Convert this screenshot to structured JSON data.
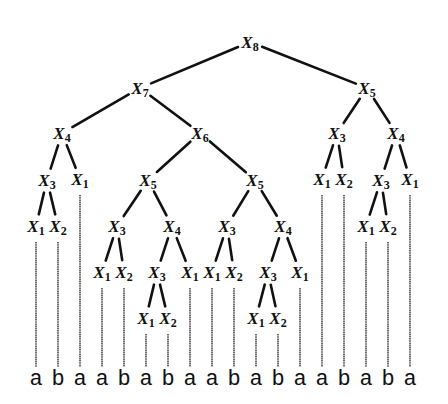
{
  "diagram": {
    "type": "derivation-tree",
    "nodes": [
      {
        "id": "n8",
        "var": "X",
        "sub": "8",
        "children": [
          "n7",
          "n5r"
        ]
      },
      {
        "id": "n7",
        "var": "X",
        "sub": "7",
        "children": [
          "n4a",
          "n6"
        ]
      },
      {
        "id": "n4a",
        "var": "X",
        "sub": "4",
        "children": [
          "n3a",
          "l2"
        ]
      },
      {
        "id": "n3a",
        "var": "X",
        "sub": "3",
        "children": [
          "l0",
          "l1"
        ]
      },
      {
        "id": "n6",
        "var": "X",
        "sub": "6",
        "children": [
          "n5a",
          "n5b"
        ]
      },
      {
        "id": "n5a",
        "var": "X",
        "sub": "5",
        "children": [
          "n3b",
          "n4b"
        ]
      },
      {
        "id": "n3b",
        "var": "X",
        "sub": "3",
        "children": [
          "l3",
          "l4"
        ]
      },
      {
        "id": "n4b",
        "var": "X",
        "sub": "4",
        "children": [
          "n3c",
          "l7"
        ]
      },
      {
        "id": "n3c",
        "var": "X",
        "sub": "3",
        "children": [
          "l5",
          "l6"
        ]
      },
      {
        "id": "n5b",
        "var": "X",
        "sub": "5",
        "children": [
          "n3d",
          "n4c"
        ]
      },
      {
        "id": "n3d",
        "var": "X",
        "sub": "3",
        "children": [
          "l8",
          "l9"
        ]
      },
      {
        "id": "n4c",
        "var": "X",
        "sub": "4",
        "children": [
          "n3e",
          "l12"
        ]
      },
      {
        "id": "n3e",
        "var": "X",
        "sub": "3",
        "children": [
          "l10",
          "l11"
        ]
      },
      {
        "id": "n5r",
        "var": "X",
        "sub": "5",
        "children": [
          "n3f",
          "n4d"
        ]
      },
      {
        "id": "n3f",
        "var": "X",
        "sub": "3",
        "children": [
          "l13",
          "l14"
        ]
      },
      {
        "id": "n4d",
        "var": "X",
        "sub": "4",
        "children": [
          "n3g",
          "l17"
        ]
      },
      {
        "id": "n3g",
        "var": "X",
        "sub": "3",
        "children": [
          "l15",
          "l16"
        ]
      }
    ],
    "preterminals": [
      {
        "leaf": 0,
        "var": "X",
        "sub": "1"
      },
      {
        "leaf": 1,
        "var": "X",
        "sub": "2"
      },
      {
        "leaf": 2,
        "var": "X",
        "sub": "1"
      },
      {
        "leaf": 3,
        "var": "X",
        "sub": "1"
      },
      {
        "leaf": 4,
        "var": "X",
        "sub": "2"
      },
      {
        "leaf": 5,
        "var": "X",
        "sub": "1"
      },
      {
        "leaf": 6,
        "var": "X",
        "sub": "2"
      },
      {
        "leaf": 7,
        "var": "X",
        "sub": "1"
      },
      {
        "leaf": 8,
        "var": "X",
        "sub": "1"
      },
      {
        "leaf": 9,
        "var": "X",
        "sub": "2"
      },
      {
        "leaf": 10,
        "var": "X",
        "sub": "1"
      },
      {
        "leaf": 11,
        "var": "X",
        "sub": "2"
      },
      {
        "leaf": 12,
        "var": "X",
        "sub": "1"
      },
      {
        "leaf": 13,
        "var": "X",
        "sub": "1"
      },
      {
        "leaf": 14,
        "var": "X",
        "sub": "2"
      },
      {
        "leaf": 15,
        "var": "X",
        "sub": "1"
      },
      {
        "leaf": 16,
        "var": "X",
        "sub": "2"
      },
      {
        "leaf": 17,
        "var": "X",
        "sub": "1"
      }
    ],
    "leaves": [
      "a",
      "b",
      "a",
      "a",
      "b",
      "a",
      "b",
      "a",
      "a",
      "b",
      "a",
      "b",
      "a",
      "a",
      "b",
      "a",
      "b",
      "a"
    ]
  }
}
